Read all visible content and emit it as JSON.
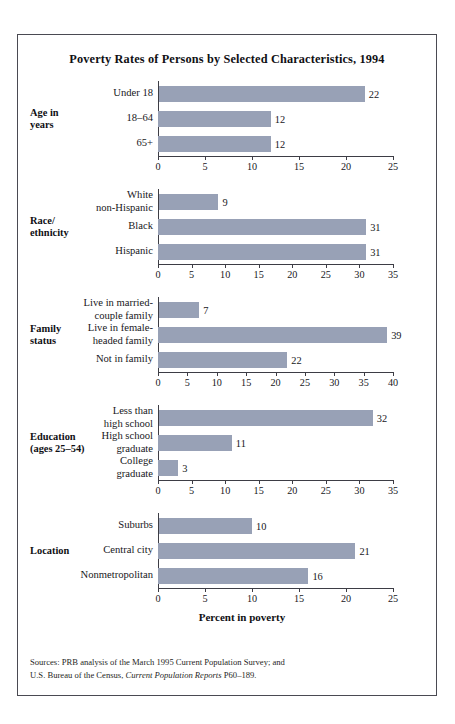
{
  "title": "Poverty Rates of Persons by Selected Characteristics, 1994",
  "axis_caption": "Percent in poverty",
  "sources": {
    "line1": "Sources: PRB analysis of the March 1995 Current Population Survey; and",
    "line2_prefix": "U.S. Bureau of the Census, ",
    "line2_italic": "Current Population Reports",
    "line2_suffix": " P60–189."
  },
  "colors": {
    "bar": "#98a1b6",
    "axis": "#3d3d45",
    "border": "#4a4a52",
    "text": "#17171b"
  },
  "chart_data": {
    "type": "bar",
    "title": "Poverty Rates of Persons by Selected Characteristics, 1994",
    "xlabel": "Percent in poverty",
    "ylabel": "",
    "orientation": "horizontal",
    "grid": false,
    "legend": "none",
    "panels": [
      {
        "group": "Age in years",
        "group_lines": [
          "Age in",
          "years"
        ],
        "categories": [
          "Under 18",
          "18–64",
          "65+"
        ],
        "category_lines": [
          [
            "Under 18"
          ],
          [
            "18–64"
          ],
          [
            "65+"
          ]
        ],
        "values": [
          22,
          12,
          12
        ],
        "xlim": [
          0,
          25
        ],
        "ticks": [
          0,
          5,
          10,
          15,
          20,
          25
        ]
      },
      {
        "group": "Race/ethnicity",
        "group_lines": [
          "Race/",
          "ethnicity"
        ],
        "categories": [
          "White non-Hispanic",
          "Black",
          "Hispanic"
        ],
        "category_lines": [
          [
            "White",
            "non-Hispanic"
          ],
          [
            "Black"
          ],
          [
            "Hispanic"
          ]
        ],
        "values": [
          9,
          31,
          31
        ],
        "xlim": [
          0,
          35
        ],
        "ticks": [
          0,
          5,
          10,
          15,
          20,
          25,
          30,
          35
        ]
      },
      {
        "group": "Family status",
        "group_lines": [
          "Family",
          "status"
        ],
        "categories": [
          "Live in married-couple family",
          "Live in female-headed family",
          "Not in family"
        ],
        "category_lines": [
          [
            "Live in married-",
            "couple family"
          ],
          [
            "Live in female-",
            "headed family"
          ],
          [
            "Not in family"
          ]
        ],
        "values": [
          7,
          39,
          22
        ],
        "xlim": [
          0,
          40
        ],
        "ticks": [
          0,
          5,
          10,
          15,
          20,
          25,
          30,
          35,
          40
        ]
      },
      {
        "group": "Education (ages 25–54)",
        "group_lines": [
          "Education",
          "(ages 25–54)"
        ],
        "categories": [
          "Less than high school",
          "High school graduate",
          "College graduate"
        ],
        "category_lines": [
          [
            "Less than",
            "high school"
          ],
          [
            "High school",
            "graduate"
          ],
          [
            "College",
            "graduate"
          ]
        ],
        "values": [
          32,
          11,
          3
        ],
        "xlim": [
          0,
          35
        ],
        "ticks": [
          0,
          5,
          10,
          15,
          20,
          25,
          30,
          35
        ]
      },
      {
        "group": "Location",
        "group_lines": [
          "Location"
        ],
        "categories": [
          "Suburbs",
          "Central city",
          "Nonmetropolitan"
        ],
        "category_lines": [
          [
            "Suburbs"
          ],
          [
            "Central city"
          ],
          [
            "Nonmetropolitan"
          ]
        ],
        "values": [
          10,
          21,
          16
        ],
        "xlim": [
          0,
          25
        ],
        "ticks": [
          0,
          5,
          10,
          15,
          20,
          25
        ]
      }
    ]
  }
}
